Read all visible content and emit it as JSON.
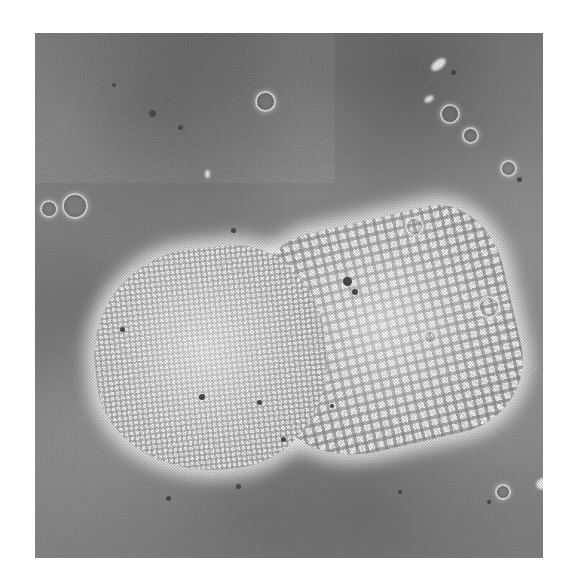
{
  "image": {
    "kind": "light-micrograph",
    "subject": "diatom frustule",
    "modality": "phase-contrast light microscopy",
    "reproduction": "halftone print",
    "color_mode": "grayscale",
    "canvas": {
      "width": 569,
      "height": 585,
      "background": "#ffffff"
    },
    "plate": {
      "left": 35,
      "top": 33,
      "width": 508,
      "height": 525
    },
    "colors": {
      "page_background": "#ffffff",
      "field_background_dark": "#6f6f6f",
      "field_background_mid": "#8a8a8a",
      "field_background_light": "#9a9a9a",
      "specimen_bright": "#f2f2f0",
      "specimen_highlight": "#fafaf8",
      "areolae_shadow": "#6e6e6c",
      "debris_dark": "#3c3c3c",
      "debris_bright": "#f8f8f8"
    }
  },
  "specimen": {
    "label": "diatom frustule",
    "bounding_box": {
      "left": 95,
      "top": 218,
      "width": 368,
      "height": 285
    },
    "valves": [
      {
        "name": "left-valve",
        "description": "rounded valve with fine areolae and scalloped margin",
        "areolae_pattern": "fine",
        "rotation_deg": -6
      },
      {
        "name": "right-valve",
        "description": "angular valve with coarse square areolae and marginal striae rows",
        "areolae_pattern": "coarse-square",
        "rotation_deg": -13
      }
    ]
  },
  "artifacts": {
    "rings": [
      {
        "left": 62,
        "top": 193,
        "size": 22
      },
      {
        "left": 40,
        "top": 200,
        "size": 14
      },
      {
        "left": 255,
        "top": 91,
        "size": 17
      },
      {
        "left": 440,
        "top": 104,
        "size": 16
      },
      {
        "left": 462,
        "top": 127,
        "size": 13
      },
      {
        "left": 405,
        "top": 217,
        "size": 15
      },
      {
        "left": 478,
        "top": 296,
        "size": 18
      },
      {
        "left": 500,
        "top": 160,
        "size": 13
      },
      {
        "left": 495,
        "top": 484,
        "size": 12
      },
      {
        "left": 423,
        "top": 330,
        "size": 10
      }
    ],
    "specks": [
      {
        "left": 149,
        "top": 110,
        "size": 7
      },
      {
        "left": 178,
        "top": 125,
        "size": 5
      },
      {
        "left": 112,
        "top": 83,
        "size": 4
      },
      {
        "left": 343,
        "top": 277,
        "size": 9
      },
      {
        "left": 352,
        "top": 289,
        "size": 6
      },
      {
        "left": 231,
        "top": 228,
        "size": 5
      },
      {
        "left": 120,
        "top": 327,
        "size": 5
      },
      {
        "left": 199,
        "top": 394,
        "size": 6
      },
      {
        "left": 257,
        "top": 400,
        "size": 5
      },
      {
        "left": 281,
        "top": 437,
        "size": 5
      },
      {
        "left": 236,
        "top": 484,
        "size": 5
      },
      {
        "left": 166,
        "top": 496,
        "size": 5
      },
      {
        "left": 398,
        "top": 490,
        "size": 4
      },
      {
        "left": 451,
        "top": 70,
        "size": 5
      },
      {
        "left": 517,
        "top": 177,
        "size": 5
      },
      {
        "left": 487,
        "top": 500,
        "size": 4
      },
      {
        "left": 330,
        "top": 404,
        "size": 4
      }
    ],
    "flecks": [
      {
        "left": 430,
        "top": 60,
        "width": 17,
        "height": 9,
        "rotation_deg": -38
      },
      {
        "left": 424,
        "top": 96,
        "width": 10,
        "height": 6,
        "rotation_deg": -30
      },
      {
        "left": 205,
        "top": 170,
        "width": 5,
        "height": 8,
        "rotation_deg": 0
      },
      {
        "left": 536,
        "top": 478,
        "width": 14,
        "height": 11,
        "rotation_deg": -25
      }
    ]
  }
}
